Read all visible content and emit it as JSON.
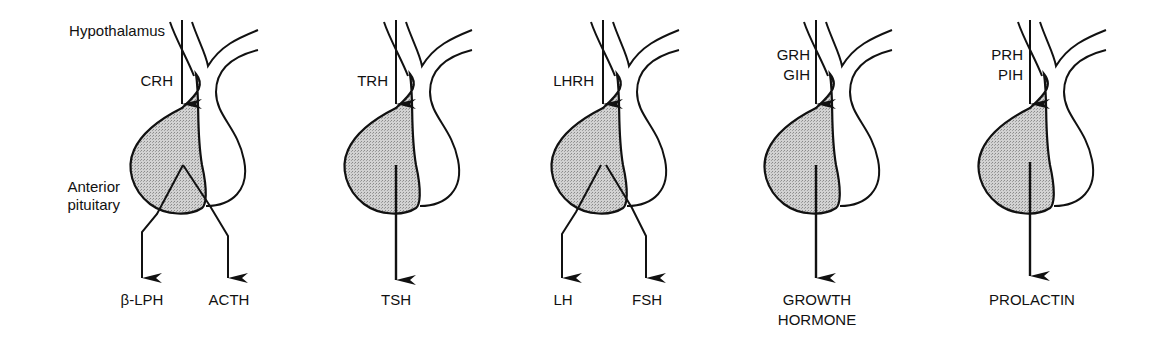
{
  "labels": {
    "hypothalamus": "Hypothalamus",
    "anterior_pituitary_line1": "Anterior",
    "anterior_pituitary_line2": "pituitary"
  },
  "panels": [
    {
      "releasing": [
        "CRH"
      ],
      "outputs": [
        "β-LPH",
        "ACTH"
      ]
    },
    {
      "releasing": [
        "TRH"
      ],
      "outputs": [
        "TSH"
      ]
    },
    {
      "releasing": [
        "LHRH"
      ],
      "outputs": [
        "LH",
        "FSH"
      ]
    },
    {
      "releasing": [
        "GRH",
        "GIH"
      ],
      "outputs": [
        "GROWTH",
        "HORMONE"
      ]
    },
    {
      "releasing": [
        "PRH",
        "PIH"
      ],
      "outputs": [
        "PROLACTIN"
      ]
    }
  ],
  "colors": {
    "line": "#111111",
    "anterior_fill": "#c8c8c8",
    "background": "#ffffff"
  }
}
